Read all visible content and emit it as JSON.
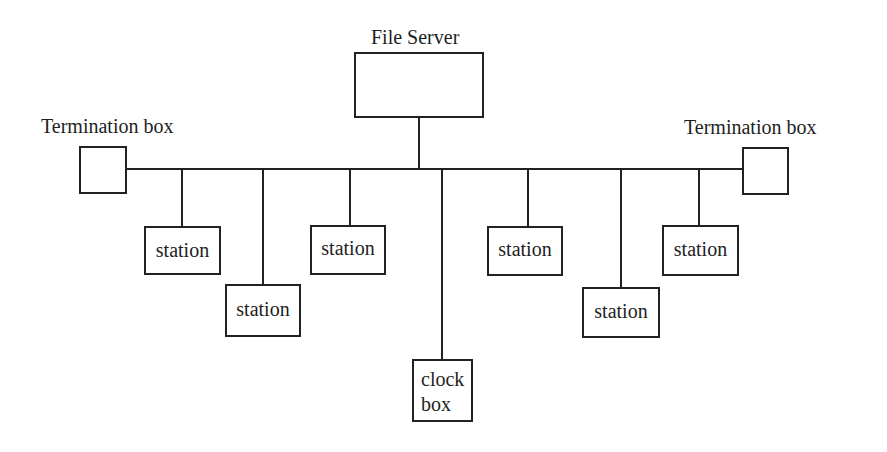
{
  "diagram": {
    "type": "network-bus-topology",
    "line_color": "#222222",
    "background": "#ffffff",
    "file_server": {
      "label": "File Server",
      "box": {
        "x": 354,
        "y": 52,
        "w": 130,
        "h": 66
      },
      "stem": {
        "x": 418,
        "y1": 117,
        "y2": 169
      }
    },
    "bus": {
      "x1": 125,
      "x2": 743,
      "y": 168
    },
    "termination_left": {
      "label": "Termination box",
      "label_pos": {
        "x": 41,
        "y": 116
      },
      "box": {
        "x": 79,
        "y": 146,
        "w": 48,
        "h": 48
      }
    },
    "termination_right": {
      "label": "Termination box",
      "label_pos": {
        "x": 684,
        "y": 117
      },
      "box": {
        "x": 742,
        "y": 147,
        "w": 47,
        "h": 48
      }
    },
    "stations": [
      {
        "label": "station",
        "drop_x": 181,
        "box": {
          "x": 144,
          "y": 226,
          "w": 77,
          "h": 49
        }
      },
      {
        "label": "station",
        "drop_x": 262,
        "box": {
          "x": 225,
          "y": 284,
          "w": 76,
          "h": 53
        }
      },
      {
        "label": "station",
        "drop_x": 349,
        "box": {
          "x": 310,
          "y": 225,
          "w": 76,
          "h": 50
        }
      },
      {
        "label": "station",
        "drop_x": 527,
        "box": {
          "x": 487,
          "y": 226,
          "w": 76,
          "h": 50
        }
      },
      {
        "label": "station",
        "drop_x": 620,
        "box": {
          "x": 582,
          "y": 287,
          "w": 78,
          "h": 51
        }
      },
      {
        "label": "station",
        "drop_x": 698,
        "box": {
          "x": 662,
          "y": 225,
          "w": 77,
          "h": 51
        }
      }
    ],
    "clock_box": {
      "label_line1": "clock",
      "label_line2": "box",
      "drop_x": 441,
      "box": {
        "x": 412,
        "y": 359,
        "w": 61,
        "h": 63
      }
    }
  }
}
